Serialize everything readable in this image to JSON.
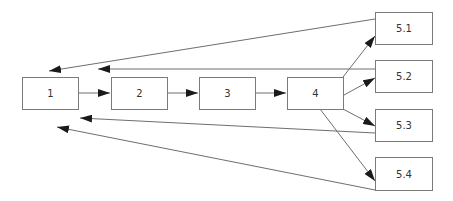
{
  "diagram": {
    "type": "flowchart",
    "nodes": [
      {
        "id": "n1",
        "label": "1",
        "x": 22,
        "y": 77,
        "w": 57,
        "h": 33
      },
      {
        "id": "n2",
        "label": "2",
        "x": 111,
        "y": 77,
        "w": 57,
        "h": 33
      },
      {
        "id": "n3",
        "label": "3",
        "x": 199,
        "y": 77,
        "w": 57,
        "h": 33
      },
      {
        "id": "n4",
        "label": "4",
        "x": 287,
        "y": 77,
        "w": 57,
        "h": 33
      },
      {
        "id": "n51",
        "label": "5.1",
        "x": 375,
        "y": 12,
        "w": 58,
        "h": 33
      },
      {
        "id": "n52",
        "label": "5.2",
        "x": 375,
        "y": 60,
        "w": 58,
        "h": 33
      },
      {
        "id": "n53",
        "label": "5.3",
        "x": 375,
        "y": 109,
        "w": 58,
        "h": 33
      },
      {
        "id": "n54",
        "label": "5.4",
        "x": 375,
        "y": 157,
        "w": 58,
        "h": 34
      }
    ],
    "edges": [
      {
        "from": "1",
        "to": "2"
      },
      {
        "from": "2",
        "to": "3"
      },
      {
        "from": "3",
        "to": "4"
      },
      {
        "from": "4",
        "to": "5.1"
      },
      {
        "from": "4",
        "to": "5.2"
      },
      {
        "from": "4",
        "to": "5.3"
      },
      {
        "from": "4",
        "to": "5.4"
      },
      {
        "from": "5.1",
        "to": "1"
      },
      {
        "from": "5.2",
        "to": "1"
      },
      {
        "from": "5.3",
        "to": "1"
      },
      {
        "from": "5.4",
        "to": "1"
      }
    ],
    "colors": {
      "stroke": "#6e6e6e",
      "arrowhead": "#1a1a1a",
      "text": "#333333"
    }
  }
}
